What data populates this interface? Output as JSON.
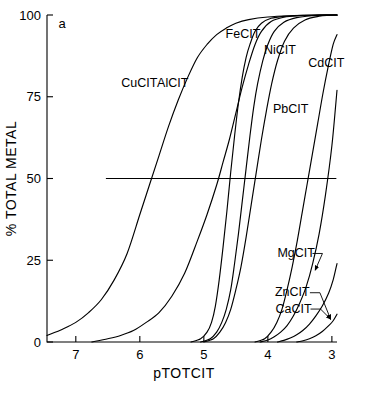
{
  "figure": {
    "panel_label": "a",
    "background": "#ffffff",
    "ink_color": "#000000"
  },
  "axes": {
    "x_title": "pTOTCIT",
    "y_title": "% TOTAL METAL",
    "x_ticks": [
      "7",
      "6",
      "5",
      "4",
      "3"
    ],
    "y_ticks": [
      "100",
      "75",
      "50",
      "25",
      "0"
    ]
  },
  "chart_data": {
    "type": "line",
    "title": "",
    "subtitle": "",
    "xlabel": "pTOTCIT",
    "ylabel": "% TOTAL METAL",
    "xlim": [
      7.45,
      2.92
    ],
    "ylim": [
      0,
      100
    ],
    "x_ticks": [
      7,
      6,
      5,
      4,
      3
    ],
    "y_ticks": [
      0,
      25,
      50,
      75,
      100
    ],
    "x_axis_direction": "decreasing-left-to-right",
    "grid": false,
    "legend": "inline-curve-labels",
    "annotations": [
      {
        "text": "a",
        "x": 7.27,
        "y": 96,
        "type": "panel-label"
      },
      {
        "text": "50% reference line",
        "type": "horizontal-line",
        "y": 50,
        "x_start": 6.53,
        "x_end": 2.93
      }
    ],
    "reference_lines": [
      {
        "orientation": "horizontal",
        "value": 50,
        "x_start": 6.53,
        "x_end": 2.93
      }
    ],
    "series": [
      {
        "name": "CuCIT",
        "label_x": 6.29,
        "label_y": 78,
        "midpoint_pTOTCIT": 5.66,
        "x": [
          7.45,
          7.2,
          7.0,
          6.8,
          6.6,
          6.4,
          6.2,
          6.0,
          5.85,
          5.7,
          5.55,
          5.4,
          5.25,
          5.1,
          4.95,
          4.8,
          4.65,
          4.5,
          4.3,
          4.0,
          3.6,
          3.2,
          2.92
        ],
        "values": [
          2,
          4,
          6,
          9,
          13,
          19,
          27,
          39,
          48,
          57,
          66,
          74,
          81,
          87,
          91,
          94,
          96,
          97.5,
          98.6,
          99.4,
          99.8,
          100,
          100
        ]
      },
      {
        "name": "AlCIT",
        "label_x": 5.73,
        "label_y": 78,
        "midpoint_pTOTCIT": 4.64,
        "x": [
          6.75,
          6.5,
          6.3,
          6.1,
          5.9,
          5.7,
          5.5,
          5.3,
          5.1,
          4.95,
          4.8,
          4.7,
          4.6,
          4.5,
          4.4,
          4.3,
          4.2,
          4.1,
          3.95,
          3.75,
          3.5,
          3.2,
          2.92
        ],
        "values": [
          0,
          1,
          2,
          3.5,
          6,
          9,
          14,
          21,
          31,
          39,
          48,
          55,
          62,
          70,
          78,
          85,
          91,
          95,
          98,
          99.3,
          99.8,
          100,
          100
        ]
      },
      {
        "name": "FeCIT",
        "label_x": 4.66,
        "label_y": 93,
        "midpoint_pTOTCIT": 4.5,
        "x": [
          5.2,
          5.05,
          4.95,
          4.88,
          4.82,
          4.76,
          4.7,
          4.64,
          4.58,
          4.52,
          4.46,
          4.4,
          4.34,
          4.28,
          4.2,
          4.1,
          3.95,
          3.75,
          3.45,
          3.1,
          2.92
        ],
        "values": [
          0,
          1,
          3,
          6,
          11,
          19,
          29,
          40,
          52,
          63,
          73,
          81,
          87,
          91,
          95,
          97.5,
          99,
          99.6,
          99.9,
          100,
          100
        ]
      },
      {
        "name": "NiCIT",
        "label_x": 4.06,
        "label_y": 88,
        "midpoint_pTOTCIT": 4.33,
        "x": [
          5.05,
          4.9,
          4.8,
          4.72,
          4.65,
          4.58,
          4.52,
          4.46,
          4.4,
          4.34,
          4.28,
          4.22,
          4.16,
          4.08,
          4.0,
          3.9,
          3.75,
          3.55,
          3.3,
          3.05,
          2.92
        ],
        "values": [
          0,
          1,
          3,
          6,
          10,
          16,
          24,
          33,
          43,
          53,
          63,
          72,
          79,
          86,
          91,
          95,
          97.8,
          99.2,
          99.8,
          100,
          100
        ]
      },
      {
        "name": "PbCIT",
        "label_x": 3.92,
        "label_y": 70,
        "midpoint_pTOTCIT": 4.2,
        "x": [
          5.0,
          4.85,
          4.75,
          4.66,
          4.58,
          4.5,
          4.42,
          4.34,
          4.26,
          4.18,
          4.1,
          4.02,
          3.94,
          3.85,
          3.74,
          3.6,
          3.42,
          3.2,
          3.05,
          2.92
        ],
        "values": [
          0,
          1,
          3,
          6,
          10,
          16,
          23,
          32,
          42,
          52,
          62,
          71,
          79,
          86,
          92,
          96,
          98.5,
          99.6,
          99.9,
          100
        ]
      },
      {
        "name": "CdCIT",
        "label_x": 3.37,
        "label_y": 84,
        "midpoint_pTOTCIT": 3.32,
        "x": [
          4.2,
          4.05,
          3.95,
          3.86,
          3.78,
          3.7,
          3.62,
          3.54,
          3.46,
          3.38,
          3.3,
          3.22,
          3.14,
          3.06,
          2.98,
          2.92
        ],
        "values": [
          0,
          1,
          3,
          6,
          10,
          16,
          23,
          31,
          40,
          49,
          58,
          67,
          76,
          84,
          91,
          94
        ]
      },
      {
        "name": "MgCIT",
        "label_x": 3.85,
        "label_y": 26,
        "arrow_to_x": 3.26,
        "arrow_to_y": 22,
        "x": [
          4.12,
          4.0,
          3.9,
          3.8,
          3.7,
          3.6,
          3.5,
          3.4,
          3.3,
          3.2,
          3.1,
          3.0,
          2.92
        ],
        "values": [
          0,
          0.6,
          1.6,
          3,
          5,
          8,
          12,
          17,
          24,
          33,
          45,
          60,
          77
        ]
      },
      {
        "name": "ZnCIT",
        "label_x": 3.89,
        "label_y": 14,
        "arrow_to_x": 3.02,
        "arrow_to_y": 7,
        "x": [
          3.85,
          3.75,
          3.65,
          3.55,
          3.45,
          3.35,
          3.25,
          3.15,
          3.05,
          2.98,
          2.92
        ],
        "values": [
          0,
          0.5,
          1.2,
          2.2,
          3.6,
          5.5,
          8,
          11,
          15,
          19,
          24
        ]
      },
      {
        "name": "CaCIT",
        "label_x": 3.88,
        "label_y": 9,
        "arrow_to_x": 3.02,
        "arrow_to_y": 7,
        "x": [
          3.55,
          3.45,
          3.35,
          3.25,
          3.15,
          3.05,
          2.98,
          2.92
        ],
        "values": [
          0,
          0.4,
          1.0,
          1.9,
          3.2,
          5.0,
          6.5,
          8.5
        ]
      }
    ]
  }
}
